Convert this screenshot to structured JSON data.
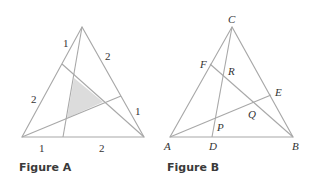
{
  "figure_a": {
    "caption": "Figure A",
    "labels": {
      "left_upper": "1",
      "left_lower": "2",
      "right_upper": "2",
      "right_lower": "1",
      "bottom_left": "1",
      "bottom_right": "2"
    },
    "shaded_region_color": "#d9d9d9"
  },
  "figure_b": {
    "caption": "Figure B",
    "points": {
      "A": "A",
      "B": "B",
      "C": "C",
      "D": "D",
      "E": "E",
      "F": "F",
      "P": "P",
      "Q": "Q",
      "R": "R"
    }
  },
  "colors": {
    "line": "#a8a8a8",
    "text": "#333333"
  }
}
